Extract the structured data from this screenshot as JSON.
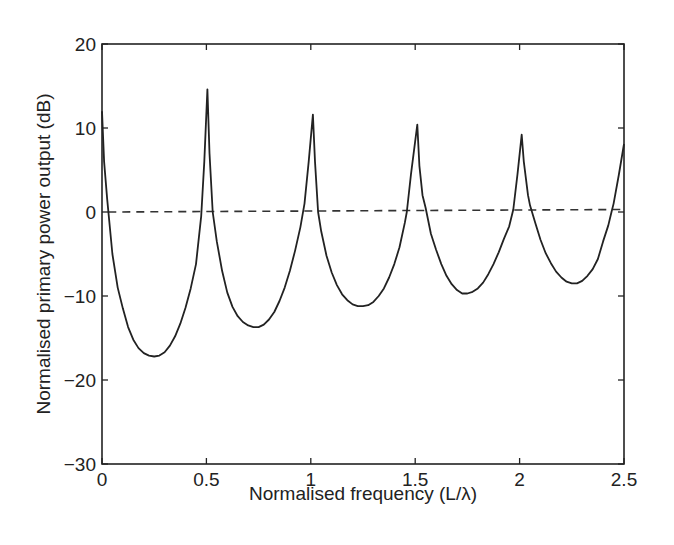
{
  "chart_data": {
    "type": "line",
    "title": "",
    "xlabel": "Normalised frequency (L/λ)",
    "ylabel": "Normalised primary power output (dB)",
    "xlim": [
      0,
      2.5
    ],
    "ylim": [
      -30,
      20
    ],
    "x_ticks": [
      0,
      0.5,
      1,
      1.5,
      2,
      2.5
    ],
    "x_tick_labels": [
      "0",
      "0.5",
      "1",
      "1.5",
      "2",
      "2.5"
    ],
    "y_ticks": [
      -30,
      -20,
      -10,
      0,
      10,
      20
    ],
    "y_tick_labels": [
      "−30",
      "−20",
      "−10",
      "0",
      "10",
      "20"
    ],
    "grid": false,
    "legend": null,
    "series": [
      {
        "name": "primary power output",
        "style": "solid",
        "color": "#222222",
        "x": [
          0,
          0.01,
          0.025,
          0.05,
          0.075,
          0.1,
          0.125,
          0.15,
          0.175,
          0.2,
          0.225,
          0.25,
          0.275,
          0.3,
          0.325,
          0.35,
          0.375,
          0.4,
          0.425,
          0.45,
          0.475,
          0.49,
          0.505,
          0.515,
          0.53,
          0.55,
          0.575,
          0.6,
          0.625,
          0.65,
          0.675,
          0.7,
          0.725,
          0.75,
          0.775,
          0.8,
          0.825,
          0.85,
          0.875,
          0.9,
          0.925,
          0.95,
          0.97,
          0.99,
          1.01,
          1.02,
          1.035,
          1.05,
          1.075,
          1.1,
          1.125,
          1.15,
          1.175,
          1.2,
          1.225,
          1.25,
          1.275,
          1.3,
          1.325,
          1.35,
          1.375,
          1.4,
          1.425,
          1.45,
          1.46,
          1.48,
          1.51,
          1.52,
          1.535,
          1.55,
          1.575,
          1.6,
          1.625,
          1.65,
          1.675,
          1.7,
          1.725,
          1.75,
          1.775,
          1.8,
          1.825,
          1.85,
          1.875,
          1.9,
          1.925,
          1.95,
          1.97,
          1.99,
          2.01,
          2.02,
          2.04,
          2.05,
          2.075,
          2.1,
          2.125,
          2.15,
          2.175,
          2.2,
          2.225,
          2.25,
          2.275,
          2.3,
          2.325,
          2.35,
          2.375,
          2.4,
          2.425,
          2.44,
          2.45,
          2.475,
          2.5
        ],
        "y": [
          12,
          6,
          1.5,
          -5,
          -9,
          -11.5,
          -13.7,
          -15.2,
          -16.2,
          -16.8,
          -17.1,
          -17.2,
          -17.1,
          -16.7,
          -15.9,
          -14.8,
          -13.3,
          -11.4,
          -9.1,
          -6.2,
          -0.5,
          6,
          14.6,
          7,
          0,
          -3.5,
          -7,
          -9.6,
          -11.3,
          -12.4,
          -13.1,
          -13.5,
          -13.7,
          -13.7,
          -13.4,
          -12.8,
          -11.9,
          -10.6,
          -9,
          -7,
          -4.6,
          -1.8,
          1,
          6,
          11.6,
          6,
          0,
          -2.3,
          -5.2,
          -7.2,
          -8.7,
          -9.8,
          -10.5,
          -11,
          -11.2,
          -11.2,
          -11.1,
          -10.7,
          -10,
          -9.1,
          -7.8,
          -6.2,
          -4.2,
          -1.3,
          0,
          4.5,
          10.4,
          5.5,
          2,
          0.5,
          -2.6,
          -4.5,
          -6.2,
          -7.6,
          -8.6,
          -9.3,
          -9.7,
          -9.7,
          -9.5,
          -9.1,
          -8.4,
          -7.4,
          -6.2,
          -4.8,
          -3.2,
          -1.7,
          0.3,
          4.5,
          9.2,
          6,
          2,
          0.8,
          -1.3,
          -3.3,
          -4.9,
          -6.1,
          -7.1,
          -7.8,
          -8.3,
          -8.5,
          -8.5,
          -8.2,
          -7.6,
          -6.8,
          -5.6,
          -3.5,
          -1.6,
          0,
          1,
          4.4,
          8.1
        ]
      },
      {
        "name": "0 dB reference",
        "style": "dashed",
        "color": "#333333",
        "x": [
          0.03,
          2.5
        ],
        "y": [
          0,
          0.3
        ]
      }
    ]
  }
}
